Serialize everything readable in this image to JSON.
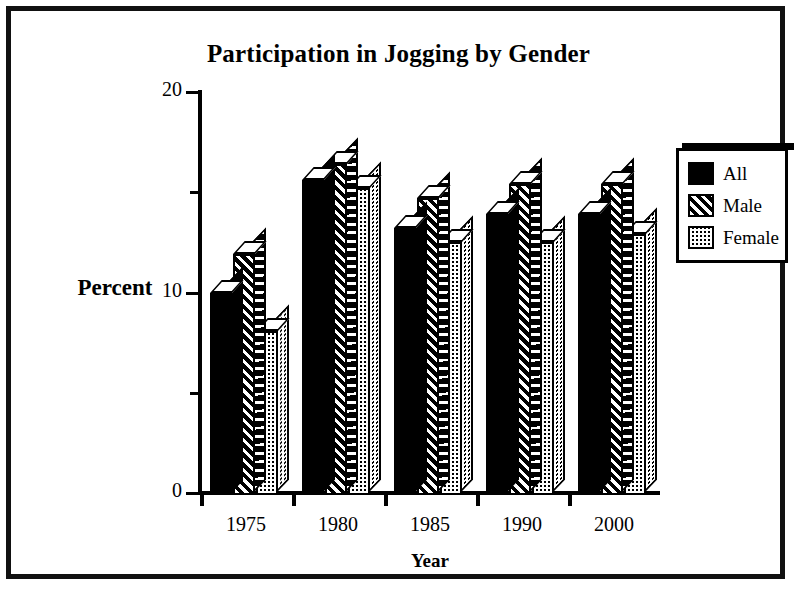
{
  "chart_data": {
    "type": "bar",
    "title": "Participation in Jogging by Gender",
    "xlabel": "Year",
    "ylabel": "Percent",
    "categories": [
      "1975",
      "1980",
      "1985",
      "1990",
      "2000"
    ],
    "series": [
      {
        "name": "All",
        "fill": "solid",
        "values": [
          10.0,
          15.6,
          13.2,
          13.9,
          13.9
        ]
      },
      {
        "name": "Male",
        "fill": "diagonal-stripe",
        "values": [
          11.9,
          16.4,
          14.7,
          15.4,
          15.4
        ]
      },
      {
        "name": "Female",
        "fill": "checker",
        "values": [
          8.1,
          15.2,
          12.5,
          12.5,
          12.9
        ]
      }
    ],
    "ylim": [
      0,
      20
    ],
    "y_ticks_major": [
      "0",
      "10",
      "20"
    ],
    "y_ticks_minor": [
      5,
      15
    ],
    "grid": false,
    "legend_position": "right",
    "style": "3d-bars-monochrome"
  },
  "legend": {
    "items": [
      {
        "label": "All"
      },
      {
        "label": "Male"
      },
      {
        "label": "Female"
      }
    ]
  },
  "colors": {
    "ink": "#000000",
    "paper": "#ffffff"
  }
}
